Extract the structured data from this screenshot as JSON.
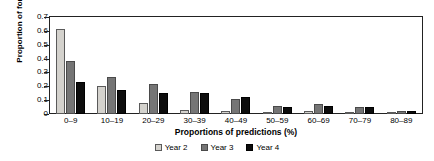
{
  "chart_data": {
    "type": "bar",
    "title": "",
    "xlabel": "Proportions of predictions (%)",
    "ylabel": "Proportion of forecasters",
    "categories": [
      "0–9",
      "10–19",
      "20–29",
      "30–39",
      "40–49",
      "50–59",
      "60–69",
      "70–79",
      "80–89"
    ],
    "series": [
      {
        "name": "Year 2",
        "color": "#d4d2cd",
        "values": [
          0.61,
          0.2,
          0.08,
          0.03,
          0.02,
          0.01,
          0.02,
          0.01,
          0.005
        ]
      },
      {
        "name": "Year 3",
        "color": "#757575",
        "values": [
          0.38,
          0.27,
          0.22,
          0.16,
          0.11,
          0.06,
          0.07,
          0.05,
          0.02
        ]
      },
      {
        "name": "Year 4",
        "color": "#0d0d0d",
        "values": [
          0.23,
          0.17,
          0.15,
          0.15,
          0.12,
          0.05,
          0.06,
          0.05,
          0.02
        ]
      }
    ],
    "ylim": [
      0,
      0.7
    ],
    "yticks": [
      "0",
      "0.1",
      "0.2",
      "0.3",
      "0.4",
      "0.5",
      "0.6",
      "0.7"
    ],
    "grid": false,
    "legend_position": "bottom"
  }
}
